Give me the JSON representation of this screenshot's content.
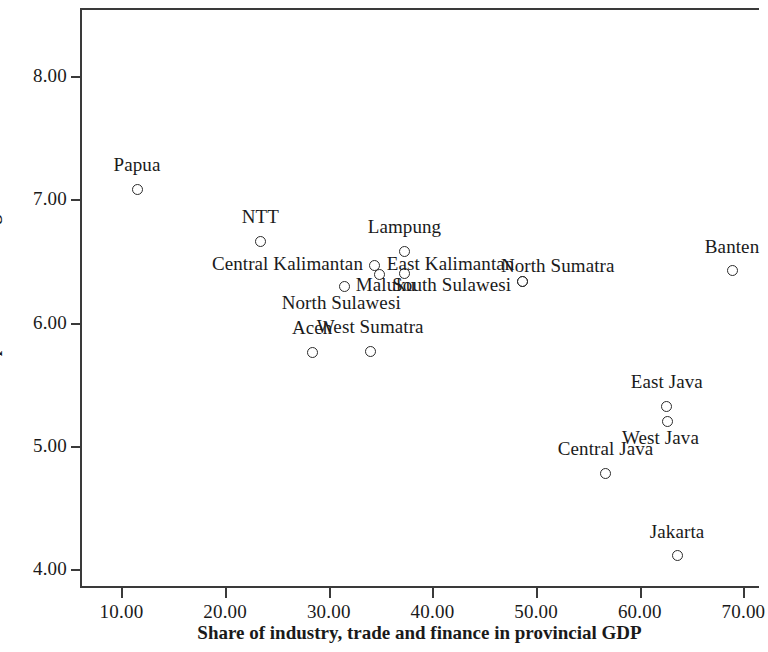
{
  "chart_data": {
    "type": "scatter",
    "title": "",
    "xlabel": "Share of industry, trade and finance in provincial GDP",
    "ylabel": "CPI provincial average",
    "xlim": [
      6.0,
      71.5
    ],
    "ylim": [
      3.85,
      8.55
    ],
    "xticks": [
      "10.00",
      "20.00",
      "30.00",
      "40.00",
      "50.00",
      "60.00",
      "70.00"
    ],
    "xtick_values": [
      10,
      20,
      30,
      40,
      50,
      60,
      70
    ],
    "yticks": [
      "4.00",
      "5.00",
      "6.00",
      "7.00",
      "8.00"
    ],
    "ytick_values": [
      4,
      5,
      6,
      7,
      8
    ],
    "grid": false,
    "legend": null,
    "marker": "open-circle",
    "points": [
      {
        "label": "Papua",
        "x": 11.5,
        "y": 7.08,
        "lx": 11.5,
        "ly": 7.26,
        "align": "c"
      },
      {
        "label": "NTT",
        "x": 23.4,
        "y": 6.66,
        "lx": 23.4,
        "ly": 6.84,
        "align": "c"
      },
      {
        "label": "Central Kalimantan",
        "x": 34.4,
        "y": 6.46,
        "lx": 33.3,
        "ly": 6.46,
        "align": "r"
      },
      {
        "label": "North Sulawesi",
        "x": 34.9,
        "y": 6.39,
        "lx": 31.2,
        "ly": 6.14,
        "align": "c"
      },
      {
        "label": "Maluku",
        "x": 31.5,
        "y": 6.29,
        "lx": 32.6,
        "ly": 6.29,
        "align": "l"
      },
      {
        "label": "Lampung",
        "x": 37.3,
        "y": 6.58,
        "lx": 37.3,
        "ly": 6.76,
        "align": "c"
      },
      {
        "label": "East Kalimantan",
        "x": 37.3,
        "y": 6.4,
        "lx": 35.6,
        "ly": 6.46,
        "align": "l"
      },
      {
        "label": "South Sulawesi",
        "x": 48.7,
        "y": 6.33,
        "lx": 47.6,
        "ly": 6.29,
        "align": "r"
      },
      {
        "label": "North Sumatra",
        "x": 48.7,
        "y": 6.33,
        "lx": 46.6,
        "ly": 6.44,
        "align": "l"
      },
      {
        "label": "Banten",
        "x": 68.9,
        "y": 6.42,
        "lx": 68.9,
        "ly": 6.6,
        "align": "c"
      },
      {
        "label": "Aceh",
        "x": 28.4,
        "y": 5.76,
        "lx": 28.4,
        "ly": 5.94,
        "align": "c"
      },
      {
        "label": "West Sumatra",
        "x": 34.0,
        "y": 5.77,
        "lx": 34.0,
        "ly": 5.95,
        "align": "c"
      },
      {
        "label": "East Java",
        "x": 62.6,
        "y": 5.32,
        "lx": 62.6,
        "ly": 5.5,
        "align": "c"
      },
      {
        "label": "West Java",
        "x": 62.7,
        "y": 5.2,
        "lx": 62.0,
        "ly": 5.05,
        "align": "c"
      },
      {
        "label": "Central Java",
        "x": 56.7,
        "y": 4.78,
        "lx": 56.7,
        "ly": 4.96,
        "align": "c"
      },
      {
        "label": "Jakarta",
        "x": 63.6,
        "y": 4.11,
        "lx": 63.6,
        "ly": 4.29,
        "align": "c"
      }
    ]
  }
}
